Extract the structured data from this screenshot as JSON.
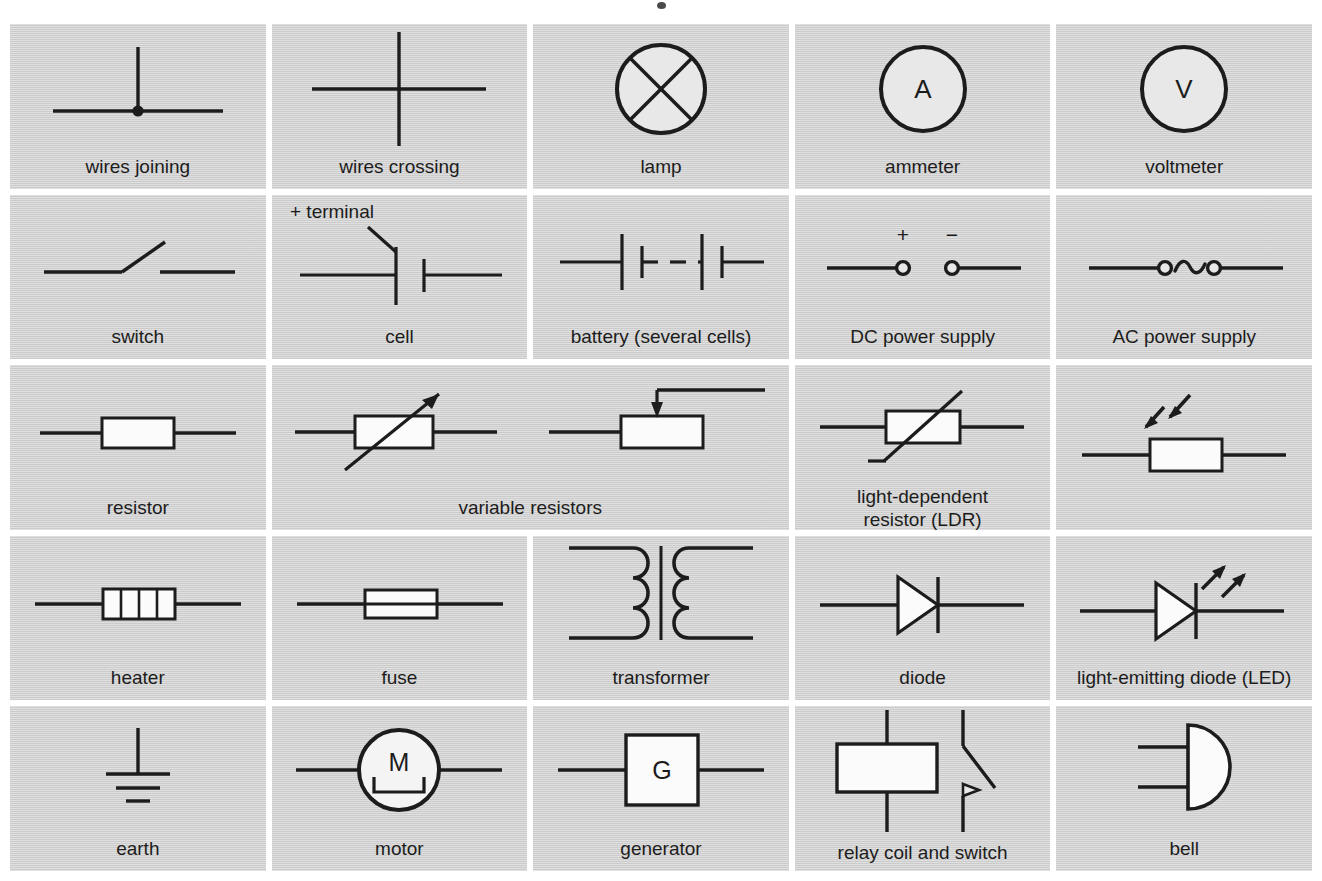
{
  "sheet": {
    "title": "circuit symbols reference chart",
    "background_color": "#ffffff",
    "cell_color": "#d2d2d2",
    "ink_color": "#1c1c1c",
    "columns": 5,
    "rows": 5
  },
  "rows": [
    {
      "index": 1,
      "cells": [
        {
          "symbol": "wires-joining",
          "caption": "wires joining",
          "annotation": ""
        },
        {
          "symbol": "wires-crossing",
          "caption": "wires crossing",
          "annotation": ""
        },
        {
          "symbol": "lamp",
          "caption": "lamp",
          "annotation": ""
        },
        {
          "symbol": "ammeter",
          "caption": "ammeter",
          "annotation": "A"
        },
        {
          "symbol": "voltmeter",
          "caption": "voltmeter",
          "annotation": "V"
        }
      ]
    },
    {
      "index": 2,
      "cells": [
        {
          "symbol": "switch",
          "caption": "switch",
          "annotation": ""
        },
        {
          "symbol": "cell",
          "caption": "cell",
          "annotation": "+ terminal"
        },
        {
          "symbol": "battery",
          "caption": "battery (several cells)",
          "annotation": ""
        },
        {
          "symbol": "dc-power-supply",
          "caption": "DC power supply",
          "annotation": "+ −"
        },
        {
          "symbol": "ac-power-supply",
          "caption": "AC power supply",
          "annotation": ""
        }
      ]
    },
    {
      "index": 3,
      "cells": [
        {
          "symbol": "resistor",
          "caption": "resistor",
          "annotation": ""
        },
        {
          "symbol": "variable-resistors",
          "caption": "variable resistors",
          "annotation": "",
          "span": 2
        },
        {
          "symbol": "thermistor",
          "caption": "thermistor",
          "annotation": ""
        },
        {
          "symbol": "ldr",
          "caption": "light-dependent\nresistor (LDR)",
          "annotation": ""
        }
      ]
    },
    {
      "index": 4,
      "cells": [
        {
          "symbol": "heater",
          "caption": "heater",
          "annotation": ""
        },
        {
          "symbol": "fuse",
          "caption": "fuse",
          "annotation": ""
        },
        {
          "symbol": "transformer",
          "caption": "transformer",
          "annotation": ""
        },
        {
          "symbol": "diode",
          "caption": "diode",
          "annotation": ""
        },
        {
          "symbol": "led",
          "caption": "light-emitting diode (LED)",
          "annotation": ""
        }
      ]
    },
    {
      "index": 5,
      "cells": [
        {
          "symbol": "earth",
          "caption": "earth",
          "annotation": ""
        },
        {
          "symbol": "motor",
          "caption": "motor",
          "annotation": "M"
        },
        {
          "symbol": "generator",
          "caption": "generator",
          "annotation": "G"
        },
        {
          "symbol": "relay-coil-and-switch",
          "caption": "relay coil and switch",
          "annotation": ""
        },
        {
          "symbol": "bell",
          "caption": "bell",
          "annotation": ""
        }
      ]
    }
  ],
  "labels": {
    "plus_terminal": "+ terminal",
    "plus_sign": "+",
    "minus_sign": "−",
    "ammeter_letter": "A",
    "voltmeter_letter": "V",
    "motor_letter": "M",
    "generator_letter": "G"
  }
}
